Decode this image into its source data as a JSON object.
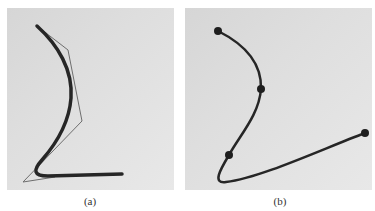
{
  "figure": {
    "panels": [
      {
        "id": "a",
        "caption": "(a)",
        "description": "Thick smooth curve with thin control polygon",
        "control_polygon": [
          [
            37,
            26
          ],
          [
            68,
            50
          ],
          [
            82,
            121
          ],
          [
            23,
            182
          ],
          [
            55,
            177
          ]
        ],
        "curve_points": [
          [
            37,
            26
          ],
          [
            55,
            45
          ],
          [
            67,
            68
          ],
          [
            71,
            95
          ],
          [
            66,
            120
          ],
          [
            55,
            142
          ],
          [
            40,
            162
          ],
          [
            35,
            172
          ],
          [
            45,
            175
          ],
          [
            80,
            175
          ],
          [
            122,
            174
          ]
        ]
      },
      {
        "id": "b",
        "caption": "(b)",
        "description": "Curve passing through four marked points",
        "marked_points": [
          [
            218,
            31
          ],
          [
            261,
            89
          ],
          [
            229,
            155
          ],
          [
            365,
            133
          ]
        ],
        "curve_points": [
          [
            218,
            31
          ],
          [
            245,
            50
          ],
          [
            258,
            70
          ],
          [
            261,
            89
          ],
          [
            252,
            115
          ],
          [
            238,
            138
          ],
          [
            229,
            155
          ],
          [
            220,
            170
          ],
          [
            219,
            181
          ],
          [
            240,
            180
          ],
          [
            300,
            160
          ],
          [
            365,
            133
          ]
        ]
      }
    ],
    "colors": {
      "curve": "#262626",
      "polygon": "#6e6e6e",
      "background": "#e0e0e0"
    }
  }
}
